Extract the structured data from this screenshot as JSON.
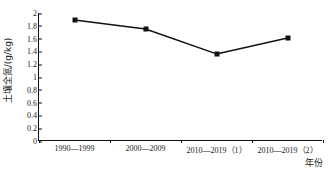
{
  "chart_data": {
    "type": "line",
    "title": "",
    "xlabel": "年份",
    "ylabel": "土壤全氮/(g/kg)",
    "categories": [
      "1990—1999",
      "2000—2009",
      "2010—2019（1）",
      "2010—2019（2）"
    ],
    "values": [
      1.89,
      1.75,
      1.36,
      1.61
    ],
    "series": [
      {
        "name": "土壤全氮",
        "values": [
          1.89,
          1.75,
          1.36,
          1.61
        ]
      }
    ],
    "ylim": [
      0,
      2
    ],
    "ytick_labels": [
      "0",
      "0.2",
      "0.4",
      "0.6",
      "0.8",
      "1",
      "1.2",
      "1.4",
      "1.6",
      "1.8",
      "2"
    ],
    "ytick_values": [
      0,
      0.2,
      0.4,
      0.6,
      0.8,
      1,
      1.2,
      1.4,
      1.6,
      1.8,
      2
    ],
    "grid": false,
    "legend": "none",
    "marker": "square",
    "line_color": "#111111",
    "marker_color": "#111111"
  }
}
